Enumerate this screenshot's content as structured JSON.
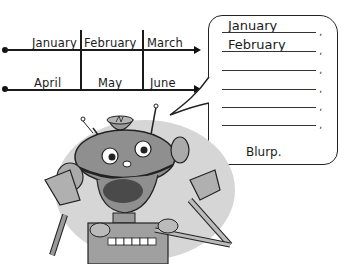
{
  "timeline": {
    "row1": {
      "months": [
        "January",
        "February",
        "March"
      ]
    },
    "row2": {
      "months": [
        "April",
        "May",
        "June"
      ]
    }
  },
  "speech_bubble": {
    "answers": [
      "January",
      "February",
      "",
      "",
      "",
      ""
    ],
    "punctuation": ",",
    "closing": "Blurp."
  },
  "illustration": {
    "character": "robot-icon",
    "colors": {
      "ink": "#1a1a1a",
      "robot_gray": "#8f8f8f",
      "shadow_gray": "#c8c8c8"
    }
  }
}
